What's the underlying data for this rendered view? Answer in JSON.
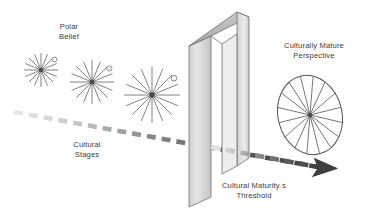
{
  "diagram": {
    "background_color": "#ffffff",
    "labels": {
      "polar_belief": "Polar\nBelief",
      "cultural_stages": "Cultural\nStages",
      "cultural_maturity_threshold": "Cultural Maturity s\nThreshold",
      "culturally_mature_perspective": "Culturally Mature\nPerspective"
    },
    "colors": {
      "text": "#3a3a3a",
      "line": "#6b6b6b",
      "arrow_dark": "#4a4a4a",
      "arrow_light": "#dcdcdc",
      "doorway_light": "#e4e4e4",
      "doorway_mid": "#c0c0c0",
      "doorway_dark": "#9a9a9a",
      "outline": "#555555"
    },
    "stars": [
      {
        "name": "polar-belief-star-1",
        "cx": 41,
        "cy": 70,
        "radius": 17,
        "spokes": 8,
        "ring_angle": -38,
        "ring_radius": 2.6
      },
      {
        "name": "polar-belief-star-2",
        "cx": 92,
        "cy": 82,
        "radius": 22,
        "spokes": 8,
        "ring_angle": -38,
        "ring_radius": 2.8
      },
      {
        "name": "polar-belief-star-3",
        "cx": 152,
        "cy": 95,
        "radius": 28,
        "spokes": 8,
        "ring_angle": -38,
        "ring_radius": 3.0
      }
    ],
    "ellipse": {
      "name": "culturally-mature-perspective-ellipse",
      "cx": 310,
      "cy": 115,
      "rx": 32,
      "ry": 40,
      "rotation": -14,
      "spokes": 8
    },
    "doorway": {
      "name": "cultural-maturity-threshold-doorway",
      "outer_top_left_x": 189,
      "outer_top_left_y": 46,
      "outer_top_right_x": 237,
      "outer_top_right_y": 12
    },
    "arrow": {
      "name": "cultural-stages-arrow",
      "start_x": 14,
      "start_y": 112,
      "end_x": 334,
      "end_y": 170,
      "dash_count": 22,
      "head_length": 18
    }
  }
}
